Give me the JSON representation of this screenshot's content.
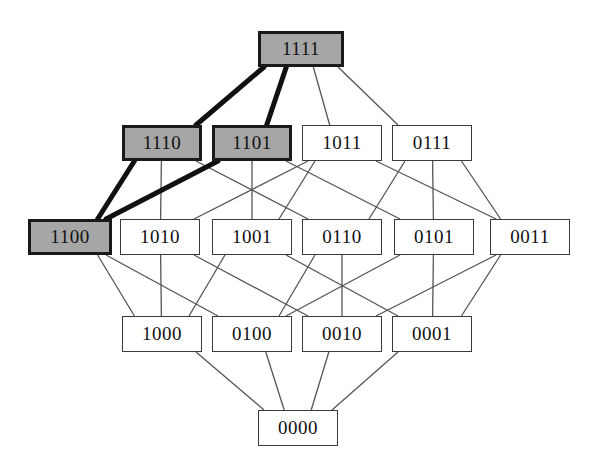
{
  "diagram": {
    "type": "hasse-diagram",
    "canvas": {
      "width": 591,
      "height": 476
    },
    "colors": {
      "background": "#ffffff",
      "node_fill": "#ffffff",
      "node_fill_highlight": "#a6a6a6",
      "node_border": "#3a3a3a",
      "node_border_highlight": "#1a1a1a",
      "edge": "#555555",
      "edge_highlight": "#111111",
      "text": "#111111"
    },
    "levels": [
      {
        "level": 4,
        "y": 31,
        "labels": [
          "1111"
        ]
      },
      {
        "level": 3,
        "y": 125,
        "labels": [
          "1110",
          "1101",
          "1011",
          "0111"
        ]
      },
      {
        "level": 2,
        "y": 219,
        "labels": [
          "1100",
          "1010",
          "1001",
          "0110",
          "0101",
          "0011"
        ]
      },
      {
        "level": 1,
        "y": 316,
        "labels": [
          "1000",
          "0100",
          "0010",
          "0001"
        ]
      },
      {
        "level": 0,
        "y": 410,
        "labels": [
          "0000"
        ]
      }
    ],
    "nodes": [
      {
        "id": "1111",
        "label": "1111",
        "x": 258,
        "y": 31,
        "w": 86,
        "h": 36,
        "highlight": true
      },
      {
        "id": "1110",
        "label": "1110",
        "x": 122,
        "y": 125,
        "w": 80,
        "h": 36,
        "highlight": true
      },
      {
        "id": "1101",
        "label": "1101",
        "x": 212,
        "y": 125,
        "w": 80,
        "h": 36,
        "highlight": true
      },
      {
        "id": "1011",
        "label": "1011",
        "x": 302,
        "y": 125,
        "w": 80,
        "h": 36,
        "highlight": false
      },
      {
        "id": "0111",
        "label": "0111",
        "x": 392,
        "y": 125,
        "w": 80,
        "h": 36,
        "highlight": false
      },
      {
        "id": "1100",
        "label": "1100",
        "x": 28,
        "y": 219,
        "w": 84,
        "h": 36,
        "highlight": true
      },
      {
        "id": "1010",
        "label": "1010",
        "x": 120,
        "y": 219,
        "w": 80,
        "h": 36,
        "highlight": false
      },
      {
        "id": "1001",
        "label": "1001",
        "x": 212,
        "y": 219,
        "w": 80,
        "h": 36,
        "highlight": false
      },
      {
        "id": "0110",
        "label": "0110",
        "x": 302,
        "y": 219,
        "w": 80,
        "h": 36,
        "highlight": false
      },
      {
        "id": "0101",
        "label": "0101",
        "x": 394,
        "y": 219,
        "w": 80,
        "h": 36,
        "highlight": false
      },
      {
        "id": "0011",
        "label": "0011",
        "x": 490,
        "y": 219,
        "w": 80,
        "h": 36,
        "highlight": false
      },
      {
        "id": "1000",
        "label": "1000",
        "x": 122,
        "y": 316,
        "w": 80,
        "h": 36,
        "highlight": false
      },
      {
        "id": "0100",
        "label": "0100",
        "x": 212,
        "y": 316,
        "w": 80,
        "h": 36,
        "highlight": false
      },
      {
        "id": "0010",
        "label": "0010",
        "x": 302,
        "y": 316,
        "w": 80,
        "h": 36,
        "highlight": false
      },
      {
        "id": "0001",
        "label": "0001",
        "x": 392,
        "y": 316,
        "w": 80,
        "h": 36,
        "highlight": false
      },
      {
        "id": "0000",
        "label": "0000",
        "x": 258,
        "y": 410,
        "w": 80,
        "h": 36,
        "highlight": false
      }
    ],
    "edges": [
      {
        "from": "1111",
        "to": "1110",
        "highlight": true
      },
      {
        "from": "1111",
        "to": "1101",
        "highlight": true
      },
      {
        "from": "1111",
        "to": "1011",
        "highlight": false
      },
      {
        "from": "1111",
        "to": "0111",
        "highlight": false
      },
      {
        "from": "1110",
        "to": "1100",
        "highlight": true
      },
      {
        "from": "1110",
        "to": "1010",
        "highlight": false
      },
      {
        "from": "1110",
        "to": "0110",
        "highlight": false
      },
      {
        "from": "1101",
        "to": "1100",
        "highlight": true
      },
      {
        "from": "1101",
        "to": "1001",
        "highlight": false
      },
      {
        "from": "1101",
        "to": "0101",
        "highlight": false
      },
      {
        "from": "1011",
        "to": "1010",
        "highlight": false
      },
      {
        "from": "1011",
        "to": "1001",
        "highlight": false
      },
      {
        "from": "1011",
        "to": "0011",
        "highlight": false
      },
      {
        "from": "0111",
        "to": "0110",
        "highlight": false
      },
      {
        "from": "0111",
        "to": "0101",
        "highlight": false
      },
      {
        "from": "0111",
        "to": "0011",
        "highlight": false
      },
      {
        "from": "1100",
        "to": "1000",
        "highlight": false
      },
      {
        "from": "1100",
        "to": "0100",
        "highlight": false
      },
      {
        "from": "1010",
        "to": "1000",
        "highlight": false
      },
      {
        "from": "1010",
        "to": "0010",
        "highlight": false
      },
      {
        "from": "1001",
        "to": "1000",
        "highlight": false
      },
      {
        "from": "1001",
        "to": "0001",
        "highlight": false
      },
      {
        "from": "0110",
        "to": "0100",
        "highlight": false
      },
      {
        "from": "0110",
        "to": "0010",
        "highlight": false
      },
      {
        "from": "0101",
        "to": "0100",
        "highlight": false
      },
      {
        "from": "0101",
        "to": "0001",
        "highlight": false
      },
      {
        "from": "0011",
        "to": "0010",
        "highlight": false
      },
      {
        "from": "0011",
        "to": "0001",
        "highlight": false
      },
      {
        "from": "1000",
        "to": "0000",
        "highlight": false
      },
      {
        "from": "0100",
        "to": "0000",
        "highlight": false
      },
      {
        "from": "0010",
        "to": "0000",
        "highlight": false
      },
      {
        "from": "0001",
        "to": "0000",
        "highlight": false
      }
    ]
  }
}
